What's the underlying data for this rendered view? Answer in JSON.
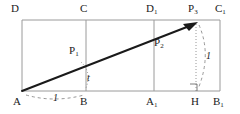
{
  "figure": {
    "canvas": {
      "width": 240,
      "height": 114
    },
    "colors": {
      "frame_stroke": "#9a9a9a",
      "vector_stroke": "#1a1a1a",
      "annotation_stroke": "#7c7c7c",
      "text": "#1a1a1a",
      "background": "#ffffff"
    },
    "vertex_labels": [
      {
        "id": "D",
        "text": "D",
        "sub": "",
        "x": 11,
        "y": 3
      },
      {
        "id": "C",
        "text": "C",
        "sub": "",
        "x": 80,
        "y": 3
      },
      {
        "id": "D1",
        "text": "D",
        "sub": "1",
        "x": 146,
        "y": 3
      },
      {
        "id": "C1",
        "text": "C",
        "sub": "1",
        "x": 215,
        "y": 3
      },
      {
        "id": "A",
        "text": "A",
        "sub": "",
        "x": 13,
        "y": 96
      },
      {
        "id": "B",
        "text": "B",
        "sub": "",
        "x": 80,
        "y": 96
      },
      {
        "id": "A1",
        "text": "A",
        "sub": "1",
        "x": 146,
        "y": 96
      },
      {
        "id": "H",
        "text": "H",
        "sub": "",
        "x": 191,
        "y": 96
      },
      {
        "id": "B1",
        "text": "B",
        "sub": "1",
        "x": 213,
        "y": 96
      }
    ],
    "point_labels": [
      {
        "id": "P1",
        "text": "P",
        "sub": "1",
        "x": 69,
        "y": 45
      },
      {
        "id": "P2",
        "text": "P",
        "sub": "2",
        "x": 154,
        "y": 37
      },
      {
        "id": "P3",
        "text": "P",
        "sub": "3",
        "x": 188,
        "y": 3
      }
    ],
    "measure_labels": [
      {
        "id": "base-length",
        "text": "1",
        "x": 53,
        "y": 93,
        "meaning": "length of segment AB"
      },
      {
        "id": "angle-param",
        "text": "t",
        "x": 87,
        "y": 73,
        "meaning": "parameter t measured at B"
      },
      {
        "id": "height-length",
        "text": "1",
        "x": 206,
        "y": 51,
        "meaning": "length of segment P3H"
      }
    ],
    "geometry": {
      "rect_left": 22,
      "rect_right": 220,
      "rect_top": 20,
      "rect_bottom": 91,
      "vertical_BC_x": 86,
      "vertical_A1D1_x": 154,
      "vector_start": {
        "x": 22,
        "y": 91
      },
      "vector_end": {
        "x": 197,
        "y": 22
      },
      "foot_H_x": 196,
      "right_angle_marker": {
        "x": 190,
        "y": 84,
        "size": 7
      }
    }
  }
}
